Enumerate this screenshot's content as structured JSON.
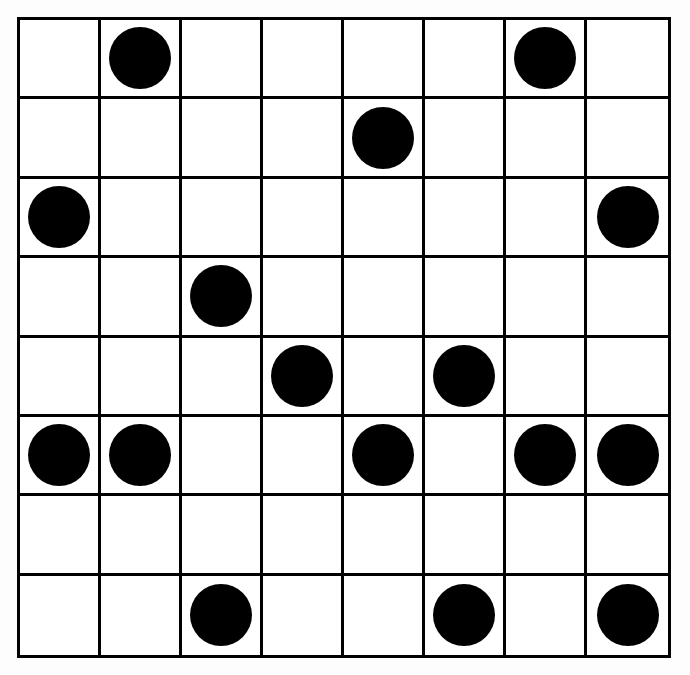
{
  "figure": {
    "background_color": "#fdfdfd",
    "cell_background_color": "#ffffff",
    "line_color": "#000000",
    "dot_color": "#000000",
    "line_width_px": 3,
    "grid_left_px": 17,
    "grid_top_px": 17,
    "grid_width_px": 654,
    "grid_height_px": 641,
    "dot_diameter_px": 62
  },
  "chart_data": {
    "type": "heatmap",
    "title": "",
    "subtitle": "",
    "xlabel": "",
    "ylabel": "",
    "rows": 8,
    "columns": 8,
    "legend": [],
    "annotations": [],
    "grid": true,
    "value_meaning": {
      "0": "empty cell",
      "1": "filled black circle"
    },
    "row_labels": [
      "1",
      "2",
      "3",
      "4",
      "5",
      "6",
      "7",
      "8"
    ],
    "column_labels": [
      "1",
      "2",
      "3",
      "4",
      "5",
      "6",
      "7",
      "8"
    ],
    "values": [
      [
        0,
        1,
        0,
        0,
        0,
        0,
        1,
        0
      ],
      [
        0,
        0,
        0,
        0,
        1,
        0,
        0,
        0
      ],
      [
        1,
        0,
        0,
        0,
        0,
        0,
        0,
        1
      ],
      [
        0,
        0,
        1,
        0,
        0,
        0,
        0,
        0
      ],
      [
        0,
        0,
        0,
        1,
        0,
        1,
        0,
        0
      ],
      [
        1,
        1,
        0,
        0,
        1,
        0,
        1,
        1
      ],
      [
        0,
        0,
        0,
        0,
        0,
        0,
        0,
        0
      ],
      [
        0,
        0,
        1,
        0,
        0,
        1,
        0,
        1
      ]
    ],
    "filled_cells": [
      {
        "row": 1,
        "column": 2
      },
      {
        "row": 1,
        "column": 7
      },
      {
        "row": 2,
        "column": 5
      },
      {
        "row": 3,
        "column": 1
      },
      {
        "row": 3,
        "column": 8
      },
      {
        "row": 4,
        "column": 3
      },
      {
        "row": 5,
        "column": 4
      },
      {
        "row": 5,
        "column": 6
      },
      {
        "row": 6,
        "column": 1
      },
      {
        "row": 6,
        "column": 2
      },
      {
        "row": 6,
        "column": 5
      },
      {
        "row": 6,
        "column": 7
      },
      {
        "row": 6,
        "column": 8
      },
      {
        "row": 8,
        "column": 3
      },
      {
        "row": 8,
        "column": 6
      },
      {
        "row": 8,
        "column": 8
      }
    ],
    "filled_count": 16,
    "empty_count": 48,
    "row_counts": [
      2,
      1,
      2,
      1,
      2,
      5,
      0,
      3
    ],
    "column_counts": [
      2,
      2,
      2,
      1,
      2,
      2,
      2,
      3
    ]
  }
}
